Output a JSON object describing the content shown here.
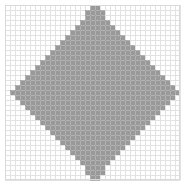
{
  "figure": {
    "type": "raster-grid-diamond",
    "width": 185,
    "height": 187,
    "background_color": "#ffffff",
    "title": "",
    "caption": ""
  },
  "plot_area": {
    "x": 5,
    "y": 5,
    "width": 175,
    "height": 177,
    "border_color": "#d9d9d9",
    "border_width": 1
  },
  "grid": {
    "cell_size": 5,
    "line_color": "#e2e2e2",
    "line_color_over_fill": "#8c8c8c",
    "line_width": 1,
    "columns": 35,
    "rows": 35,
    "visible": true
  },
  "shape": {
    "name": "diamond",
    "description": "Pixelated rotated square (diamond) filled with gray, rendered with staircase edges on a 5px grid",
    "fill_color": "#999999",
    "edge_style": "staircase",
    "center_x": 92,
    "center_y": 93,
    "half_width": 80,
    "half_height": 85,
    "vertices": [
      {
        "label": "top",
        "x": 92,
        "y": 8
      },
      {
        "label": "right",
        "x": 172,
        "y": 93
      },
      {
        "label": "bottom",
        "x": 92,
        "y": 178
      },
      {
        "label": "left",
        "x": 12,
        "y": 93
      }
    ]
  },
  "chart_data": {
    "type": "heatmap",
    "title": "",
    "subtitle": "",
    "xlabel": "",
    "ylabel": "",
    "xlim": [
      0,
      35
    ],
    "ylim": [
      0,
      35
    ],
    "grid": true,
    "legend_position": "none",
    "legend": [],
    "annotations": [],
    "xtick_labels": [],
    "ytick_labels": [],
    "colors": {
      "filled": "#999999",
      "empty": "#ffffff",
      "gridline": "#e2e2e2"
    },
    "cell_size": 5,
    "columns": 35,
    "rows": 35,
    "row_spans": [
      {
        "row": 0,
        "start": 17,
        "end": 18
      },
      {
        "row": 1,
        "start": 16,
        "end": 19
      },
      {
        "row": 2,
        "start": 16,
        "end": 19
      },
      {
        "row": 3,
        "start": 15,
        "end": 20
      },
      {
        "row": 4,
        "start": 14,
        "end": 21
      },
      {
        "row": 5,
        "start": 13,
        "end": 22
      },
      {
        "row": 6,
        "start": 12,
        "end": 23
      },
      {
        "row": 7,
        "start": 11,
        "end": 24
      },
      {
        "row": 8,
        "start": 10,
        "end": 25
      },
      {
        "row": 9,
        "start": 9,
        "end": 26
      },
      {
        "row": 10,
        "start": 8,
        "end": 27
      },
      {
        "row": 11,
        "start": 7,
        "end": 28
      },
      {
        "row": 12,
        "start": 6,
        "end": 29
      },
      {
        "row": 13,
        "start": 5,
        "end": 30
      },
      {
        "row": 14,
        "start": 4,
        "end": 31
      },
      {
        "row": 15,
        "start": 3,
        "end": 32
      },
      {
        "row": 16,
        "start": 2,
        "end": 33
      },
      {
        "row": 17,
        "start": 1,
        "end": 34
      },
      {
        "row": 18,
        "start": 2,
        "end": 33
      },
      {
        "row": 19,
        "start": 3,
        "end": 32
      },
      {
        "row": 20,
        "start": 4,
        "end": 31
      },
      {
        "row": 21,
        "start": 5,
        "end": 30
      },
      {
        "row": 22,
        "start": 6,
        "end": 29
      },
      {
        "row": 23,
        "start": 7,
        "end": 28
      },
      {
        "row": 24,
        "start": 8,
        "end": 27
      },
      {
        "row": 25,
        "start": 9,
        "end": 26
      },
      {
        "row": 26,
        "start": 10,
        "end": 25
      },
      {
        "row": 27,
        "start": 11,
        "end": 24
      },
      {
        "row": 28,
        "start": 12,
        "end": 23
      },
      {
        "row": 29,
        "start": 13,
        "end": 22
      },
      {
        "row": 30,
        "start": 14,
        "end": 21
      },
      {
        "row": 31,
        "start": 15,
        "end": 20
      },
      {
        "row": 32,
        "start": 16,
        "end": 19
      },
      {
        "row": 33,
        "start": 16,
        "end": 19
      },
      {
        "row": 34,
        "start": 17,
        "end": 18
      }
    ]
  }
}
